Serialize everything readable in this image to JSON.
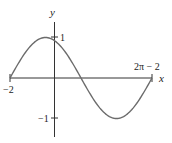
{
  "chart_data": {
    "type": "line",
    "title": "",
    "function": "y = sin(x + 2)",
    "xlabel": "x",
    "ylabel": "y",
    "xlim": [
      -2,
      4.2832
    ],
    "ylim": [
      -1,
      1
    ],
    "grid": false,
    "legend": null,
    "x_tick_labels": [
      "−2",
      "2π − 2"
    ],
    "x_ticks": [
      -2,
      4.2832
    ],
    "y_tick_labels": [
      "1",
      "−1"
    ],
    "y_ticks": [
      1,
      -1
    ],
    "series": [
      {
        "name": "curve",
        "x": [
          -2,
          -1.5,
          -1,
          -0.43,
          0,
          0.5,
          1,
          1.14,
          1.5,
          2,
          2.5,
          2.71,
          3,
          3.5,
          4,
          4.2832
        ],
        "y": [
          0,
          0.479,
          0.841,
          1.0,
          0.909,
          0.598,
          0.141,
          0.0,
          -0.351,
          -0.757,
          -0.978,
          -1.0,
          -0.959,
          -0.598,
          -0.279,
          0
        ]
      }
    ],
    "colors": {
      "curve": "#6b6b6b",
      "axes": "#333333"
    }
  },
  "labels": {
    "x_axis": "x",
    "y_axis": "y",
    "x_min": "−2",
    "x_max": "2π − 2",
    "y_max": "1",
    "y_min": "−1"
  }
}
